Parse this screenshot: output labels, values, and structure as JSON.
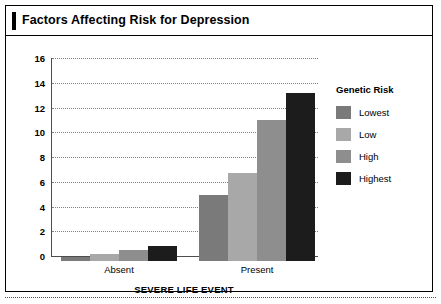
{
  "figure": {
    "title": "Factors Affecting Risk for Depression"
  },
  "legend": {
    "title": "Genetic Risk",
    "items": [
      {
        "label": "Lowest",
        "color": "#7a7a7a"
      },
      {
        "label": "Low",
        "color": "#a8a8a8"
      },
      {
        "label": "High",
        "color": "#8e8e8e"
      },
      {
        "label": "Highest",
        "color": "#1c1c1c"
      }
    ]
  },
  "chart_data": {
    "type": "bar",
    "title": "Factors Affecting Risk for Depression",
    "xlabel": "SEVERE LIFE EVENT",
    "ylabel": "",
    "categories": [
      "Absent",
      "Present"
    ],
    "ylim": [
      0,
      16
    ],
    "yticks": [
      0,
      2,
      4,
      6,
      8,
      10,
      12,
      14,
      16
    ],
    "ytick_labels": [
      "0",
      "2",
      "4",
      "6",
      "8",
      "10",
      "12",
      "14",
      "16"
    ],
    "grid": "horizontal-dotted",
    "legend_position": "right",
    "legend_title": "Genetic Risk",
    "series": [
      {
        "name": "Lowest",
        "color": "#7a7a7a",
        "values": [
          0.3,
          5.3
        ]
      },
      {
        "name": "Low",
        "color": "#a8a8a8",
        "values": [
          0.6,
          7.1
        ]
      },
      {
        "name": "High",
        "color": "#8e8e8e",
        "values": [
          0.9,
          11.4
        ]
      },
      {
        "name": "Highest",
        "color": "#1c1c1c",
        "values": [
          1.2,
          13.6
        ]
      }
    ]
  }
}
